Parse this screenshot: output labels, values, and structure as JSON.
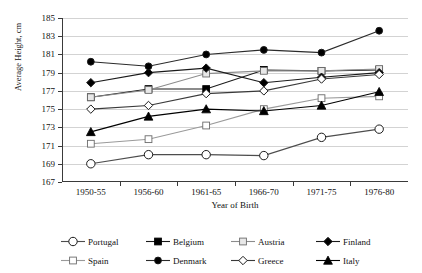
{
  "chart_data": {
    "type": "line",
    "title": "",
    "xlabel": "Year of Birth",
    "ylabel": "Average Height, cm",
    "categories": [
      "1950-55",
      "1956-60",
      "1961-65",
      "1966-70",
      "1971-75",
      "1976-80"
    ],
    "ylim": [
      167,
      185
    ],
    "ytick_step": 2,
    "yticks": [
      167,
      169,
      171,
      173,
      175,
      177,
      179,
      181,
      183,
      185
    ],
    "grid": true,
    "legend_position": "bottom",
    "series": [
      {
        "name": "Portugal",
        "marker": "circle-open",
        "color": "#4d4d4d",
        "line_color": "#4d4d4d",
        "values": [
          169.0,
          170.0,
          170.0,
          169.9,
          171.9,
          172.8
        ]
      },
      {
        "name": "Belgium",
        "marker": "square-filled",
        "color": "#000000",
        "line_color": "#1a1a1a",
        "values": [
          176.3,
          177.2,
          177.2,
          179.3,
          179.2,
          179.3
        ]
      },
      {
        "name": "Austria",
        "marker": "square-light",
        "color": "#e6e6e6",
        "line_color": "#8c8c8c",
        "values": [
          176.3,
          177.1,
          178.9,
          179.2,
          179.2,
          179.4
        ]
      },
      {
        "name": "Finland",
        "marker": "diamond-filled",
        "color": "#000000",
        "line_color": "#1a1a1a",
        "values": [
          177.9,
          179.0,
          179.5,
          177.9,
          178.5,
          179.0
        ]
      },
      {
        "name": "Spain",
        "marker": "square-white",
        "color": "#ffffff",
        "line_color": "#9a9a9a",
        "values": [
          171.2,
          171.7,
          173.2,
          175.0,
          176.2,
          176.4
        ]
      },
      {
        "name": "Denmark",
        "marker": "circle-filled",
        "color": "#000000",
        "line_color": "#2b2b2b",
        "values": [
          180.2,
          179.7,
          181.0,
          181.5,
          181.2,
          183.6
        ]
      },
      {
        "name": "Greece",
        "marker": "diamond-open",
        "color": "#ffffff",
        "line_color": "#3a3a3a",
        "values": [
          175.0,
          175.4,
          176.7,
          177.0,
          178.3,
          178.8
        ]
      },
      {
        "name": "Italy",
        "marker": "triangle-filled",
        "color": "#000000",
        "line_color": "#000000",
        "values": [
          172.5,
          174.2,
          175.0,
          174.8,
          175.4,
          176.9
        ]
      }
    ],
    "legend_order": [
      "Portugal",
      "Belgium",
      "Austria",
      "Finland",
      "Spain",
      "Denmark",
      "Greece",
      "Italy"
    ]
  }
}
